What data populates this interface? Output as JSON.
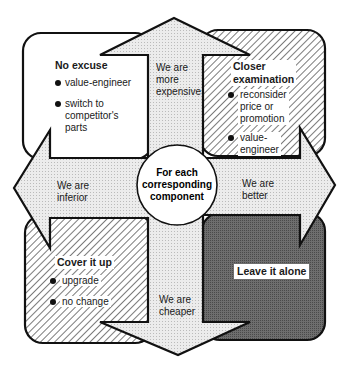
{
  "center": {
    "line1": "For each",
    "line2": "corresponding",
    "line3": "component"
  },
  "arrows": {
    "up": {
      "line1": "We are",
      "line2": "more",
      "line3": "expensive"
    },
    "left": {
      "line1": "We are",
      "line2": "inferior"
    },
    "right": {
      "line1": "We are",
      "line2": "better"
    },
    "down": {
      "line1": "We are",
      "line2": "cheaper"
    }
  },
  "quadrants": {
    "top_left": {
      "title": "No excuse",
      "bullets": [
        "value-engineer",
        "switch to",
        "competitor's",
        "parts"
      ],
      "fill": "white"
    },
    "top_right": {
      "title1": "Closer",
      "title2": "examination",
      "bullet1": [
        "reconsider",
        "price or",
        "promotion"
      ],
      "bullet2": [
        "value-",
        "engineer"
      ],
      "fill": "light-hatch"
    },
    "bottom_left": {
      "title": "Cover  it up",
      "bullets": [
        "upgrade",
        "no change"
      ],
      "fill": "light-hatch"
    },
    "bottom_right": {
      "title": "Leave it alone",
      "fill": "dark-gray"
    }
  },
  "colors": {
    "arrow_fill": "#e4e4e4",
    "dark_fill": "#6a6a6a",
    "stroke": "#111111"
  }
}
